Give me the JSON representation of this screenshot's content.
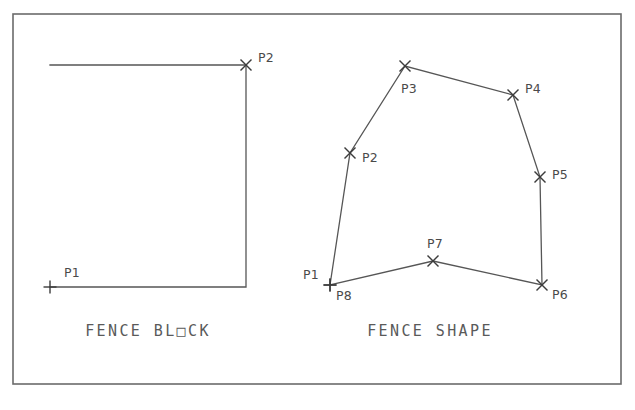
{
  "canvas": {
    "width": 635,
    "height": 410,
    "background_color": "#ffffff",
    "line_color": "#565656",
    "frame_color": "#6b6b6b",
    "text_color": "#4a4a4a"
  },
  "frame": {
    "x": 13,
    "y": 14,
    "width": 608,
    "height": 370
  },
  "figures": [
    {
      "id": "fence-block",
      "caption": "FENCE BL□CK",
      "caption_text_plain": "FENCE BLOCK",
      "caption_x": 148,
      "caption_y": 336,
      "type": "rectangle",
      "outline": [
        {
          "x": 50,
          "y": 65
        },
        {
          "x": 246,
          "y": 65
        },
        {
          "x": 246,
          "y": 287
        },
        {
          "x": 50,
          "y": 287
        }
      ],
      "closed": false,
      "points": [
        {
          "name": "P1",
          "x": 50,
          "y": 287,
          "marker": "plus",
          "label_dx": 14,
          "label_dy": -10
        },
        {
          "name": "P2",
          "x": 246,
          "y": 65,
          "marker": "cross",
          "label_dx": 12,
          "label_dy": -3
        }
      ]
    },
    {
      "id": "fence-shape",
      "caption": "FENCE SHAPE",
      "caption_text_plain": "FENCE SHAPE",
      "caption_x": 430,
      "caption_y": 336,
      "type": "polygon",
      "outline": [
        {
          "x": 330,
          "y": 285
        },
        {
          "x": 350,
          "y": 153
        },
        {
          "x": 405,
          "y": 66
        },
        {
          "x": 513,
          "y": 95
        },
        {
          "x": 540,
          "y": 177
        },
        {
          "x": 542,
          "y": 285
        },
        {
          "x": 433,
          "y": 261
        },
        {
          "x": 330,
          "y": 285
        }
      ],
      "closed": true,
      "points": [
        {
          "name": "P1",
          "x": 330,
          "y": 285,
          "marker": "plus",
          "label_dx": -27,
          "label_dy": -6
        },
        {
          "name": "P8",
          "x": 330,
          "y": 285,
          "marker": "plus",
          "label_dx": 6,
          "label_dy": 15
        },
        {
          "name": "P2",
          "x": 350,
          "y": 153,
          "marker": "cross",
          "label_dx": 12,
          "label_dy": 9
        },
        {
          "name": "P3",
          "x": 405,
          "y": 66,
          "marker": "cross",
          "label_dx": -4,
          "label_dy": 27
        },
        {
          "name": "P4",
          "x": 513,
          "y": 95,
          "marker": "cross",
          "label_dx": 12,
          "label_dy": -2
        },
        {
          "name": "P5",
          "x": 540,
          "y": 177,
          "marker": "cross",
          "label_dx": 12,
          "label_dy": 2
        },
        {
          "name": "P6",
          "x": 542,
          "y": 285,
          "marker": "cross",
          "label_dx": 10,
          "label_dy": 14
        },
        {
          "name": "P7",
          "x": 433,
          "y": 261,
          "marker": "cross",
          "label_dx": -6,
          "label_dy": -13
        }
      ]
    }
  ],
  "marker_styles": {
    "cross": {
      "arm": 5.5,
      "description": "x-shaped vertex marker"
    },
    "plus": {
      "arm": 6.5,
      "description": "plus-shaped vertex marker"
    }
  }
}
